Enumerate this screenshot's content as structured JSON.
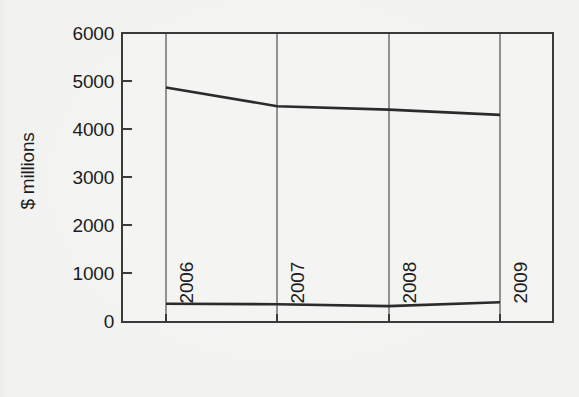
{
  "chart_data": {
    "type": "line",
    "title": "",
    "subtitle": "",
    "xlabel": "",
    "ylabel": "$ millions",
    "categories": [
      "2006",
      "2007",
      "2008",
      "2009"
    ],
    "x": [
      2006,
      2007,
      2008,
      2009
    ],
    "xlim": [
      2005.5,
      2009.5
    ],
    "ylim": [
      0,
      6000
    ],
    "yticks": [
      0,
      1000,
      2000,
      3000,
      4000,
      5000,
      6000
    ],
    "ytick_labels": [
      "0",
      "1000",
      "2000",
      "3000",
      "4000",
      "5000",
      "6000"
    ],
    "xtick_labels": [
      "2006",
      "2007",
      "2008",
      "2009"
    ],
    "grid": "vertical-only",
    "legend": "none",
    "series": [
      {
        "name": "upper-series",
        "values": [
          4870,
          4480,
          4410,
          4300
        ],
        "color": "#2b2b2b"
      },
      {
        "name": "lower-series",
        "values": [
          380,
          370,
          330,
          410
        ],
        "color": "#2b2b2b"
      }
    ]
  },
  "figure": {
    "background_color": "#f2f2f1",
    "axis_color": "#3a3a3a",
    "grid_color": "#5a5a5a",
    "text_color": "#1c1c1c"
  }
}
